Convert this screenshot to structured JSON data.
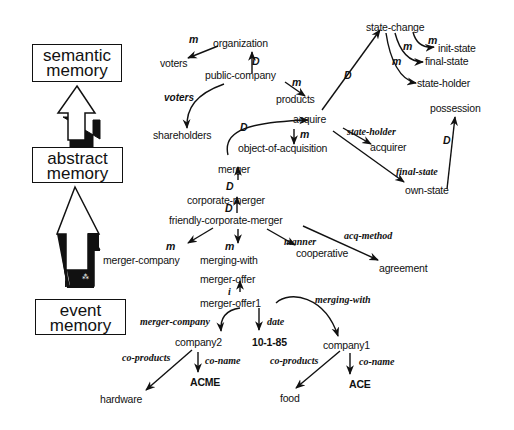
{
  "memory_levels": [
    {
      "id": "semantic",
      "line1": "semantic",
      "line2": "memory"
    },
    {
      "id": "abstract",
      "line1": "abstract",
      "line2": "memory"
    },
    {
      "id": "event",
      "line1": "event",
      "line2": "memory"
    }
  ],
  "nodes": {
    "organization": "organization",
    "voters": "voters",
    "public_company": "public-company",
    "products": "products",
    "shareholders": "shareholders",
    "state_change": "state-change",
    "init_state": "init-state",
    "final_state": "final-state",
    "state_holder": "state-holder",
    "possession": "possession",
    "acquire": "acquire",
    "object_of_acquisition": "object-of-acquisition",
    "acquirer": "acquirer",
    "own_state": "own-state",
    "merger": "merger",
    "corporate_merger": "corporate-merger",
    "friendly_corporate_merger": "friendly-corporate-merger",
    "merger_company": "merger-company",
    "merging_with": "merging-with",
    "cooperative": "cooperative",
    "agreement": "agreement",
    "merger_offer": "merger-offer",
    "merger_offer1": "merger-offer1",
    "company2": "company2",
    "date_value": "10-1-85",
    "company1": "company1",
    "hardware": "hardware",
    "acme": "ACME",
    "food": "food",
    "ace": "ACE"
  },
  "edge_labels": {
    "m_org_voters": "m",
    "D_public_org": "D",
    "m_public_products": "m",
    "voters_rel": "voters",
    "D_products_statechange": "D",
    "m_sc_init": "m",
    "m_sc_final": "m",
    "m_sc_holder": "m",
    "D_ownstate_possession": "D",
    "D_merger_acquire": "D",
    "m_acquire_object": "m",
    "state_holder_rel": "state-holder",
    "final_state_rel": "final-state",
    "D_corp_merger": "D",
    "D_friendly_corp": "D",
    "m_friendly_company": "m",
    "m_friendly_merging": "m",
    "manner_rel": "manner",
    "acq_method_rel": "acq-method",
    "i_offer1_offer": "i",
    "merger_company_rel": "merger-company",
    "date_rel": "date",
    "merging_with_rel": "merging-with",
    "co_products_2": "co-products",
    "co_name_2": "co-name",
    "co_products_1": "co-products",
    "co_name_1": "co-name"
  }
}
